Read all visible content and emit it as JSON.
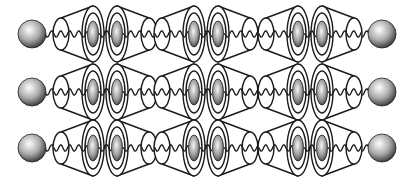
{
  "diagram": {
    "type": "polyrotaxane-schematic",
    "rows": 3,
    "pairs_per_row": 3,
    "components": {
      "stopper": "sphere-stopper",
      "ring": "cone-shaped-ring",
      "guest": "ellipsoid-guest",
      "axle": "wavy-chain"
    },
    "colors": {
      "outline": "#1a1a1a",
      "sphere_light": "#ffffff",
      "sphere_dark": "#333333",
      "guest_light": "#f2f2f2",
      "guest_dark": "#4a4a4a",
      "background": "#ffffff"
    }
  }
}
